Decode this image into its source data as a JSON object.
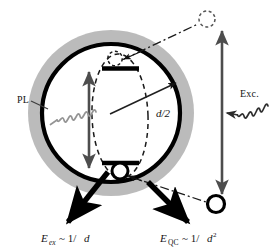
{
  "figure": {
    "background_color": "#ffffff"
  },
  "colors": {
    "shell_gray": "#b3b3b3",
    "particle_outline": "#000000",
    "pl_wave": "#8c8c8c",
    "exc_wave": "#333333",
    "band_bar": "#000000",
    "dash_ellipse": "#1a1a1a",
    "arrow_black": "#000000",
    "arrow_gray": "#555555",
    "text": "#141414"
  },
  "labels": {
    "pl": "PL",
    "exc": "Exc.",
    "radius": "d/2",
    "energy_ex": {
      "symbol": "E",
      "subscript": "ex",
      "relation": "~ 1/",
      "variable": "d",
      "exponent": ""
    },
    "energy_qc": {
      "symbol": "E",
      "subscript": "QC",
      "relation": "~ 1/",
      "variable": "d",
      "exponent": "2"
    }
  },
  "elements": {
    "shell": {
      "name": "outer-shell-circle",
      "cx": 111,
      "cy": 113,
      "r": 83
    },
    "particle": {
      "name": "nanoparticle-circle",
      "cx": 111,
      "cy": 113,
      "r": 69
    },
    "exciton_ellipse": {
      "name": "exciton-wavefunction-ellipse",
      "cx": 120,
      "cy": 116,
      "rx": 28,
      "ry": 62
    },
    "conduction_band_bar": {
      "name": "conduction-band-level",
      "x1": 103,
      "x2": 139,
      "y": 68
    },
    "valence_band_bar": {
      "name": "valence-band-level",
      "x1": 103,
      "x2": 139,
      "y": 163
    },
    "electron_in_dot": {
      "name": "electron-dashed-circle",
      "cx": 115,
      "cy": 58,
      "r": 7
    },
    "hole_in_dot": {
      "name": "hole-circle",
      "cx": 120,
      "cy": 171,
      "r": 8
    },
    "electron_outside": {
      "name": "escaped-electron-dashed-circle",
      "cx": 207,
      "cy": 19,
      "r": 8
    },
    "hole_outside": {
      "name": "escaped-hole-circle",
      "cx": 216,
      "cy": 204,
      "r": 8.5
    },
    "band_gap_arrow": {
      "name": "band-gap-double-arrow",
      "x": 89,
      "y_top": 70,
      "y_bottom": 170
    },
    "separation_arrow": {
      "name": "charge-separation-double-arrow",
      "x": 222,
      "y_top": 28,
      "y_bottom": 198
    },
    "radius_arrow": {
      "name": "radius-arrow",
      "x1": 111,
      "x2": 176,
      "y1": 113,
      "y2": 82
    }
  },
  "annotations": {
    "pl_description": "photoluminescence emission wave leaving the dot",
    "exc_description": "excitation light wave entering the dot",
    "ex_arrow_description": "exciton binding energy scaling arrow",
    "qc_arrow_description": "quantum confinement energy scaling arrow"
  }
}
